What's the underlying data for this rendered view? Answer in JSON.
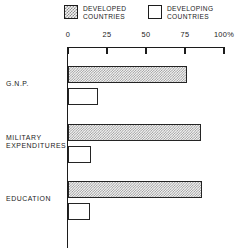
{
  "legend": {
    "items": [
      {
        "label_line1": "DEVELOPED",
        "label_line2": "COUNTRIES",
        "swatch": "hatched-square-icon",
        "fill": "hatched"
      },
      {
        "label_line1": "DEVELOPING",
        "label_line2": "COUNTRIES",
        "swatch": "empty-square-icon",
        "fill": "empty"
      }
    ]
  },
  "chart_data": {
    "type": "bar",
    "orientation": "horizontal",
    "title": "",
    "subtitle": "",
    "xlabel": "",
    "ylabel": "",
    "xlim": [
      0,
      100
    ],
    "grid": false,
    "legend_position": "top",
    "unit": "%",
    "categories": [
      "G.N.P.",
      "MILITARY EXPENDITURES",
      "EDUCATION"
    ],
    "tick_values": [
      0,
      25,
      50,
      75,
      100
    ],
    "tick_labels": [
      "0",
      "25",
      "50",
      "75",
      "100%"
    ],
    "series": [
      {
        "name": "DEVELOPED COUNTRIES",
        "fill": "hatched",
        "values": [
          76,
          85,
          86
        ]
      },
      {
        "name": "DEVELOPING COUNTRIES",
        "fill": "empty",
        "values": [
          19,
          15,
          14
        ]
      }
    ],
    "colors": {
      "axis": "#1c1c1c",
      "bar_outline": "#242424",
      "developed_fill": "#f4f4f4",
      "developed_hatch": "#9a9a9a",
      "developing_fill": "#ffffff",
      "text": "#1a1a1a",
      "background": "#ffffff"
    }
  },
  "categories_display": [
    {
      "line1": "G.N.P.",
      "line2": ""
    },
    {
      "line1": "MILITARY",
      "line2": "EXPENDITURES"
    },
    {
      "line1": "EDUCATION",
      "line2": ""
    }
  ]
}
